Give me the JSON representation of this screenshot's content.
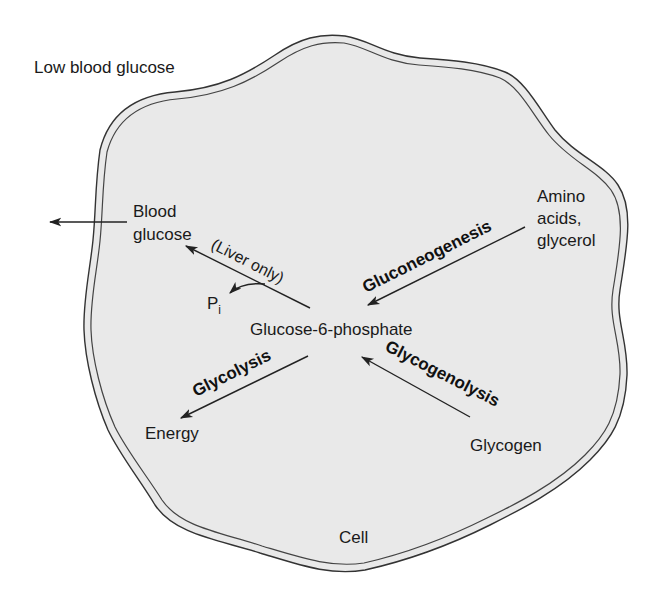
{
  "diagram": {
    "title_context": "Low blood glucose",
    "compartment_label": "Cell",
    "colors": {
      "cell_fill": "#e9e9e9",
      "membrane_stroke": "#333333",
      "text": "#1a1a1a",
      "background": "#ffffff"
    },
    "nodes": {
      "blood_glucose": {
        "line1": "Blood",
        "line2": "glucose"
      },
      "glucose_6_phosphate": {
        "label": "Glucose-6-phosphate"
      },
      "amino_acids_glycerol": {
        "line1": "Amino",
        "line2": "acids,",
        "line3": "glycerol"
      },
      "energy": {
        "label": "Energy"
      },
      "glycogen": {
        "label": "Glycogen"
      },
      "phosphate": {
        "main": "P",
        "sub": "i"
      }
    },
    "processes": {
      "gluconeogenesis": "Gluconeogenesis",
      "glycolysis": "Glycolysis",
      "glycogenolysis": "Glycogenolysis",
      "liver_only_note": "(Liver only)"
    },
    "edges": [
      {
        "from": "Blood glucose",
        "to": "outside cell",
        "label": ""
      },
      {
        "from": "Glucose-6-phosphate",
        "to": "Blood glucose",
        "label": "(Liver only)",
        "byproduct": "Pi"
      },
      {
        "from": "Amino acids, glycerol",
        "to": "Glucose-6-phosphate",
        "label": "Gluconeogenesis"
      },
      {
        "from": "Glucose-6-phosphate",
        "to": "Energy",
        "label": "Glycolysis"
      },
      {
        "from": "Glycogen",
        "to": "Glucose-6-phosphate",
        "label": "Glycogenolysis"
      }
    ]
  }
}
